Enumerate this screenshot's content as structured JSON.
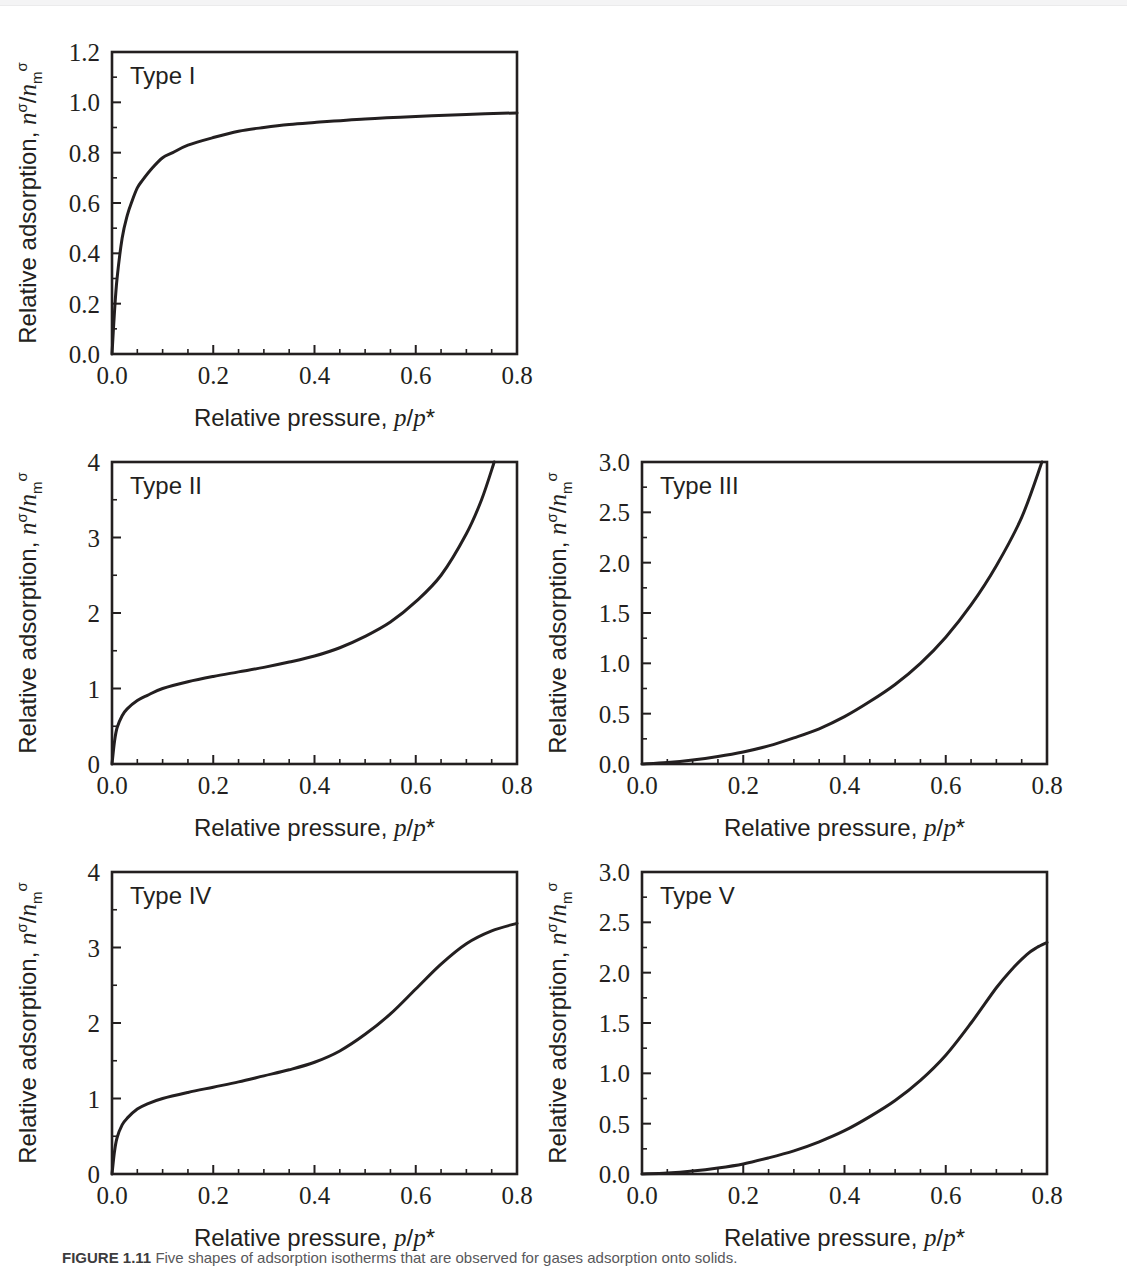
{
  "figure": {
    "caption_label": "FIGURE 1.11",
    "caption_text": "Five shapes of adsorption isotherms that are observed for gases adsorption onto solids.",
    "axis_x_title_plain": "Relative pressure, ",
    "axis_x_title_math": "p/p*",
    "axis_y_title_plain": "Relative adsorption, ",
    "axis_y_title_math": "nσ/nσm"
  },
  "chart_data": [
    {
      "type": "line",
      "title": "Type I",
      "xlabel": "Relative pressure, p/p*",
      "ylabel": "Relative adsorption, nσ/nσm",
      "xlim": [
        0.0,
        0.8
      ],
      "ylim": [
        0.0,
        1.2
      ],
      "xticks": [
        "0.0",
        "0.2",
        "0.4",
        "0.6",
        "0.8"
      ],
      "xtick_values": [
        0.0,
        0.2,
        0.4,
        0.6,
        0.8
      ],
      "yticks": [
        "0.0",
        "0.2",
        "0.4",
        "0.6",
        "0.8",
        "1.0",
        "1.2"
      ],
      "ytick_values": [
        0.0,
        0.2,
        0.4,
        0.6,
        0.8,
        1.0,
        1.2
      ],
      "x_minor_step": 0.05,
      "y_minor_step": 0.1,
      "grid": false,
      "legend": "none",
      "x": [
        0.0,
        0.005,
        0.01,
        0.02,
        0.03,
        0.04,
        0.05,
        0.06,
        0.08,
        0.1,
        0.12,
        0.15,
        0.2,
        0.25,
        0.3,
        0.35,
        0.4,
        0.5,
        0.6,
        0.7,
        0.8
      ],
      "y": [
        0.0,
        0.17,
        0.3,
        0.46,
        0.55,
        0.61,
        0.66,
        0.69,
        0.74,
        0.78,
        0.8,
        0.83,
        0.86,
        0.885,
        0.9,
        0.912,
        0.92,
        0.934,
        0.944,
        0.952,
        0.958
      ]
    },
    {
      "type": "line",
      "title": "Type II",
      "xlabel": "Relative pressure, p/p*",
      "ylabel": "Relative adsorption, nσ/nσm",
      "xlim": [
        0.0,
        0.8
      ],
      "ylim": [
        0,
        4
      ],
      "xticks": [
        "0.0",
        "0.2",
        "0.4",
        "0.6",
        "0.8"
      ],
      "xtick_values": [
        0.0,
        0.2,
        0.4,
        0.6,
        0.8
      ],
      "yticks": [
        "0",
        "1",
        "2",
        "3",
        "4"
      ],
      "ytick_values": [
        0,
        1,
        2,
        3,
        4
      ],
      "x_minor_step": 0.05,
      "y_minor_step": 0.5,
      "grid": false,
      "legend": "none",
      "x": [
        0.0,
        0.005,
        0.01,
        0.02,
        0.03,
        0.05,
        0.07,
        0.1,
        0.15,
        0.2,
        0.25,
        0.3,
        0.35,
        0.4,
        0.45,
        0.5,
        0.55,
        0.6,
        0.65,
        0.7,
        0.73,
        0.755
      ],
      "y": [
        0.0,
        0.3,
        0.48,
        0.64,
        0.73,
        0.84,
        0.91,
        1.0,
        1.09,
        1.16,
        1.22,
        1.28,
        1.35,
        1.43,
        1.54,
        1.69,
        1.88,
        2.15,
        2.5,
        3.05,
        3.5,
        4.0
      ]
    },
    {
      "type": "line",
      "title": "Type III",
      "xlabel": "Relative pressure, p/p*",
      "ylabel": "Relative adsorption, nσ/nσm",
      "xlim": [
        0.0,
        0.8
      ],
      "ylim": [
        0.0,
        3.0
      ],
      "xticks": [
        "0.0",
        "0.2",
        "0.4",
        "0.6",
        "0.8"
      ],
      "xtick_values": [
        0.0,
        0.2,
        0.4,
        0.6,
        0.8
      ],
      "yticks": [
        "0.0",
        "0.5",
        "1.0",
        "1.5",
        "2.0",
        "2.5",
        "3.0"
      ],
      "ytick_values": [
        0.0,
        0.5,
        1.0,
        1.5,
        2.0,
        2.5,
        3.0
      ],
      "x_minor_step": 0.05,
      "y_minor_step": 0.25,
      "grid": false,
      "legend": "none",
      "x": [
        0.0,
        0.05,
        0.1,
        0.15,
        0.2,
        0.25,
        0.3,
        0.35,
        0.4,
        0.45,
        0.5,
        0.55,
        0.6,
        0.65,
        0.7,
        0.75,
        0.79
      ],
      "y": [
        0.0,
        0.015,
        0.04,
        0.075,
        0.12,
        0.18,
        0.26,
        0.35,
        0.47,
        0.62,
        0.79,
        1.0,
        1.26,
        1.58,
        1.97,
        2.45,
        3.0
      ]
    },
    {
      "type": "line",
      "title": "Type IV",
      "xlabel": "Relative pressure, p/p*",
      "ylabel": "Relative adsorption, nσ/nσm",
      "xlim": [
        0.0,
        0.8
      ],
      "ylim": [
        0,
        4
      ],
      "xticks": [
        "0.0",
        "0.2",
        "0.4",
        "0.6",
        "0.8"
      ],
      "xtick_values": [
        0.0,
        0.2,
        0.4,
        0.6,
        0.8
      ],
      "yticks": [
        "0",
        "1",
        "2",
        "3",
        "4"
      ],
      "ytick_values": [
        0,
        1,
        2,
        3,
        4
      ],
      "x_minor_step": 0.05,
      "y_minor_step": 0.5,
      "grid": false,
      "legend": "none",
      "x": [
        0.0,
        0.005,
        0.01,
        0.02,
        0.03,
        0.05,
        0.07,
        0.1,
        0.15,
        0.2,
        0.25,
        0.3,
        0.35,
        0.4,
        0.45,
        0.5,
        0.55,
        0.6,
        0.65,
        0.7,
        0.75,
        0.8
      ],
      "y": [
        0.0,
        0.3,
        0.48,
        0.65,
        0.74,
        0.86,
        0.93,
        1.0,
        1.08,
        1.15,
        1.22,
        1.3,
        1.38,
        1.48,
        1.63,
        1.85,
        2.12,
        2.45,
        2.78,
        3.05,
        3.22,
        3.32
      ]
    },
    {
      "type": "line",
      "title": "Type V",
      "xlabel": "Relative pressure, p/p*",
      "ylabel": "Relative adsorption, nσ/nσm",
      "xlim": [
        0.0,
        0.8
      ],
      "ylim": [
        0.0,
        3.0
      ],
      "xticks": [
        "0.0",
        "0.2",
        "0.4",
        "0.6",
        "0.8"
      ],
      "xtick_values": [
        0.0,
        0.2,
        0.4,
        0.6,
        0.8
      ],
      "yticks": [
        "0.0",
        "0.5",
        "1.0",
        "1.5",
        "2.0",
        "2.5",
        "3.0"
      ],
      "ytick_values": [
        0.0,
        0.5,
        1.0,
        1.5,
        2.0,
        2.5,
        3.0
      ],
      "x_minor_step": 0.05,
      "y_minor_step": 0.25,
      "grid": false,
      "legend": "none",
      "x": [
        0.0,
        0.05,
        0.1,
        0.15,
        0.2,
        0.25,
        0.3,
        0.35,
        0.4,
        0.45,
        0.5,
        0.55,
        0.6,
        0.65,
        0.7,
        0.73,
        0.76,
        0.78,
        0.8
      ],
      "y": [
        0.0,
        0.01,
        0.03,
        0.06,
        0.1,
        0.16,
        0.23,
        0.32,
        0.43,
        0.57,
        0.73,
        0.93,
        1.18,
        1.5,
        1.85,
        2.03,
        2.18,
        2.25,
        2.3
      ]
    }
  ],
  "panels": [
    {
      "tag": "Type I",
      "index": 0
    },
    {
      "tag": "Type II",
      "index": 1
    },
    {
      "tag": "Type III",
      "index": 2
    },
    {
      "tag": "Type IV",
      "index": 3
    },
    {
      "tag": "Type V",
      "index": 4
    }
  ]
}
